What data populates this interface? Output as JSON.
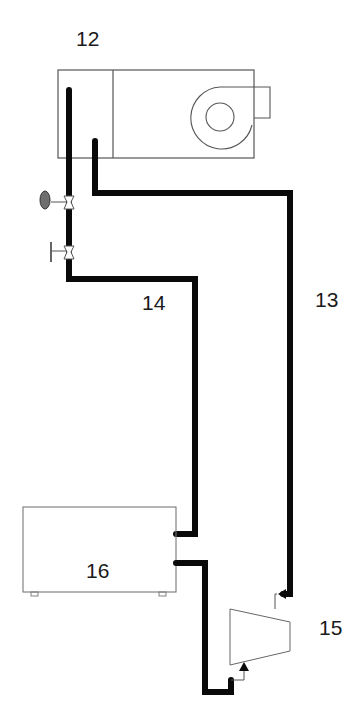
{
  "diagram": {
    "colors": {
      "background": "#ffffff",
      "pipe": "#0a0a0a",
      "outline": "#555555",
      "sensor_fill": "#6e6e6e"
    },
    "labels": {
      "unit_12": "12",
      "line_13": "13",
      "line_14": "14",
      "compressor_15": "15",
      "unit_16": "16"
    },
    "components": [
      {
        "id": "12",
        "type": "air-handling-unit-with-fan"
      },
      {
        "id": "13",
        "type": "pipe-line"
      },
      {
        "id": "14",
        "type": "pipe-line"
      },
      {
        "id": "15",
        "type": "compressor"
      },
      {
        "id": "16",
        "type": "unit-box"
      }
    ],
    "valves": [
      {
        "type": "sensor-valve"
      },
      {
        "type": "manual-valve"
      }
    ]
  }
}
